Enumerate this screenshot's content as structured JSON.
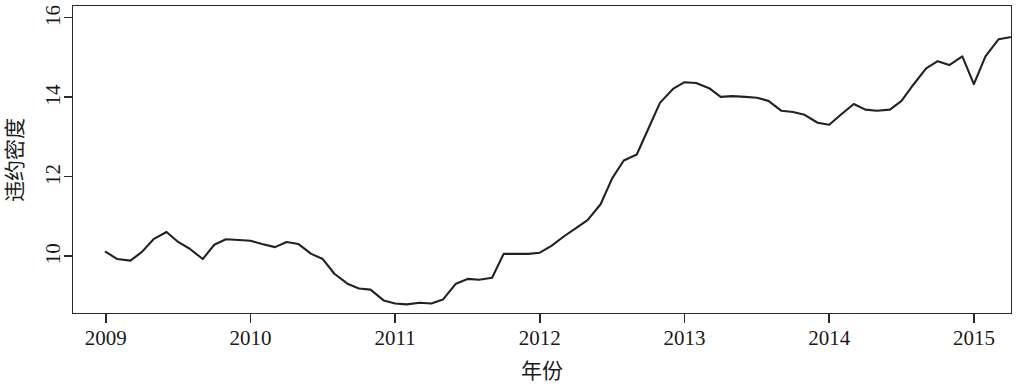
{
  "chart_data": {
    "type": "line",
    "title": "",
    "xlabel": "年份",
    "ylabel": "违约密度",
    "xlim": [
      2008.77,
      2015.26
    ],
    "ylim": [
      8.55,
      16.3
    ],
    "grid": false,
    "legend": null,
    "xticks": [
      2009,
      2010,
      2011,
      2012,
      2013,
      2014,
      2015
    ],
    "xticklabels": [
      "2009",
      "2010",
      "2011",
      "2012",
      "2013",
      "2014",
      "2015"
    ],
    "yticks": [
      10,
      12,
      14,
      16
    ],
    "yticklabels": [
      "10",
      "12",
      "14",
      "16"
    ],
    "line_color": "#222222",
    "series": [
      {
        "name": "违约密度",
        "x": [
          2009.0,
          2009.08,
          2009.17,
          2009.25,
          2009.33,
          2009.42,
          2009.5,
          2009.58,
          2009.67,
          2009.75,
          2009.83,
          2009.92,
          2010.0,
          2010.08,
          2010.17,
          2010.25,
          2010.33,
          2010.42,
          2010.5,
          2010.58,
          2010.67,
          2010.75,
          2010.83,
          2010.92,
          2011.0,
          2011.08,
          2011.17,
          2011.25,
          2011.33,
          2011.42,
          2011.5,
          2011.58,
          2011.67,
          2011.75,
          2011.83,
          2011.92,
          2012.0,
          2012.08,
          2012.17,
          2012.25,
          2012.33,
          2012.42,
          2012.5,
          2012.58,
          2012.67,
          2012.75,
          2012.83,
          2012.92,
          2013.0,
          2013.08,
          2013.17,
          2013.25,
          2013.33,
          2013.42,
          2013.5,
          2013.58,
          2013.67,
          2013.75,
          2013.83,
          2013.92,
          2014.0,
          2014.08,
          2014.17,
          2014.25,
          2014.33,
          2014.42,
          2014.5,
          2014.58,
          2014.67,
          2014.75,
          2014.83,
          2014.92,
          2015.0,
          2015.08,
          2015.17,
          2015.25
        ],
        "values": [
          10.1,
          9.92,
          9.88,
          10.1,
          10.42,
          10.6,
          10.35,
          10.18,
          9.92,
          10.28,
          10.42,
          10.4,
          10.38,
          10.3,
          10.22,
          10.35,
          10.3,
          10.05,
          9.92,
          9.55,
          9.3,
          9.18,
          9.15,
          8.88,
          8.8,
          8.78,
          8.82,
          8.8,
          8.9,
          9.3,
          9.42,
          9.4,
          9.45,
          10.05,
          10.05,
          10.05,
          10.08,
          10.25,
          10.5,
          10.7,
          10.9,
          11.3,
          11.95,
          12.4,
          12.55,
          13.2,
          13.85,
          14.2,
          14.37,
          14.35,
          14.22,
          14.0,
          14.02,
          14.0,
          13.98,
          13.9,
          13.65,
          13.62,
          13.55,
          13.35,
          13.3,
          13.55,
          13.82,
          13.68,
          13.65,
          13.68,
          13.9,
          14.3,
          14.72,
          14.9,
          14.8,
          15.02,
          14.32,
          15.02,
          15.45,
          15.5
        ]
      }
    ],
    "detailed_path_note": "monthly-like observations 2009-01 through 2015-Q1"
  },
  "axis": {
    "x_title": "年份",
    "y_title": "违约密度"
  }
}
